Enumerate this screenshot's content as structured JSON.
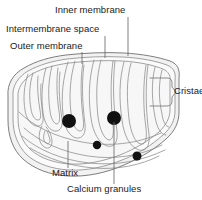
{
  "figure": {
    "width": 202,
    "height": 200,
    "background_color": "#ffffff"
  },
  "labels": {
    "inner_membrane": "Inner membrane",
    "intermembrane_space": "Intermembrane space",
    "outer_membrane": "Outer membrane",
    "cristae": "Cristae",
    "matrix": "Matrix",
    "calcium_granules": "Calcium granules"
  },
  "colors": {
    "text": "#1a1a1a",
    "membrane_line": "#8a8a8a",
    "outer_line": "#6f6f6f",
    "leader_line": "#6b6b6b",
    "bracket_line": "#7a7a7a",
    "cytoplasm_fill": "#f2f2f2",
    "matrix_fill": "#f7f7f7",
    "granule_fill": "#111111"
  },
  "granules": [
    {
      "name": "calcium-granule-large-left",
      "cx": 69,
      "cy": 121,
      "r": 7.0
    },
    {
      "name": "calcium-granule-large-right",
      "cx": 114,
      "cy": 118,
      "r": 7.0
    },
    {
      "name": "calcium-granule-small-mid",
      "cx": 97,
      "cy": 145,
      "r": 4.2
    },
    {
      "name": "calcium-granule-small-right",
      "cx": 137,
      "cy": 156,
      "r": 4.5
    }
  ],
  "leader_lines": [
    {
      "name": "leader-outer-membrane",
      "x1": 82,
      "y1": 52,
      "x2": 82,
      "y2": 64
    },
    {
      "name": "leader-intermembrane",
      "x1": 105,
      "y1": 36,
      "x2": 105,
      "y2": 58
    },
    {
      "name": "leader-inner-membrane",
      "x1": 128,
      "y1": 17,
      "x2": 128,
      "y2": 56
    },
    {
      "name": "leader-matrix",
      "x1": 68,
      "y1": 141,
      "x2": 68,
      "y2": 168
    },
    {
      "name": "leader-calcium",
      "x1": 114,
      "y1": 122,
      "x2": 114,
      "y2": 184
    }
  ],
  "bracket": {
    "name": "cristae-bracket",
    "x": 150,
    "y": 78,
    "width": 22,
    "height": 28,
    "pointer_x": 176,
    "pointer_y": 92
  }
}
